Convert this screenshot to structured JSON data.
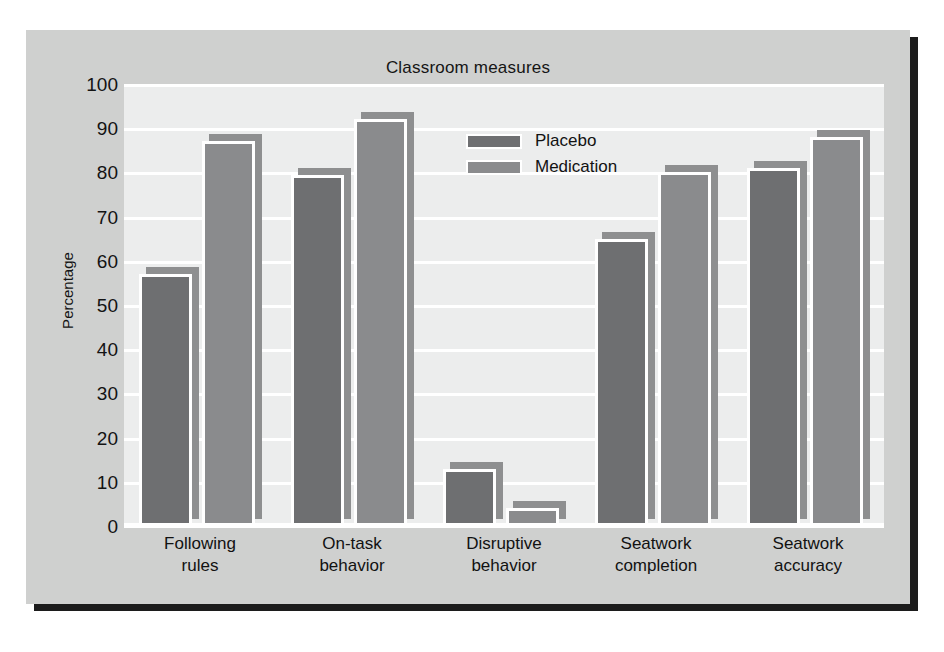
{
  "chart_data": {
    "type": "bar",
    "title": "Classroom measures",
    "xlabel": "",
    "ylabel": "Percentage",
    "ylim": [
      0,
      100
    ],
    "ytick_step": 10,
    "yticks": [
      0,
      10,
      20,
      30,
      40,
      50,
      60,
      70,
      80,
      90,
      100
    ],
    "grid": true,
    "legend_position": "top-center-right",
    "categories": [
      "Following\nrules",
      "On-task\nbehavior",
      "Disruptive\nbehavior",
      "Seatwork\ncompletion",
      "Seatwork\naccuracy"
    ],
    "categories_lines": [
      [
        "Following",
        "rules"
      ],
      [
        "On-task",
        "behavior"
      ],
      [
        "Disruptive",
        "behavior"
      ],
      [
        "Seatwork",
        "completion"
      ],
      [
        "Seatwork",
        "accuracy"
      ]
    ],
    "series": [
      {
        "name": "Placebo",
        "color": "#6e6f71",
        "values": [
          57,
          79.5,
          13,
          65,
          81
        ]
      },
      {
        "name": "Medication",
        "color": "#8a8b8d",
        "values": [
          87,
          92,
          4,
          80,
          88
        ]
      }
    ]
  },
  "colors": {
    "panel_background": "#cfd0cf",
    "plot_background": "#eceded",
    "gridline": "#ffffff",
    "placebo": "#6e6f71",
    "medication": "#8a8b8d",
    "bar_shadow": "#8e8f90",
    "bar_outline": "#ffffff",
    "figure_shadow": "#1c1c1c",
    "text": "#131313"
  }
}
